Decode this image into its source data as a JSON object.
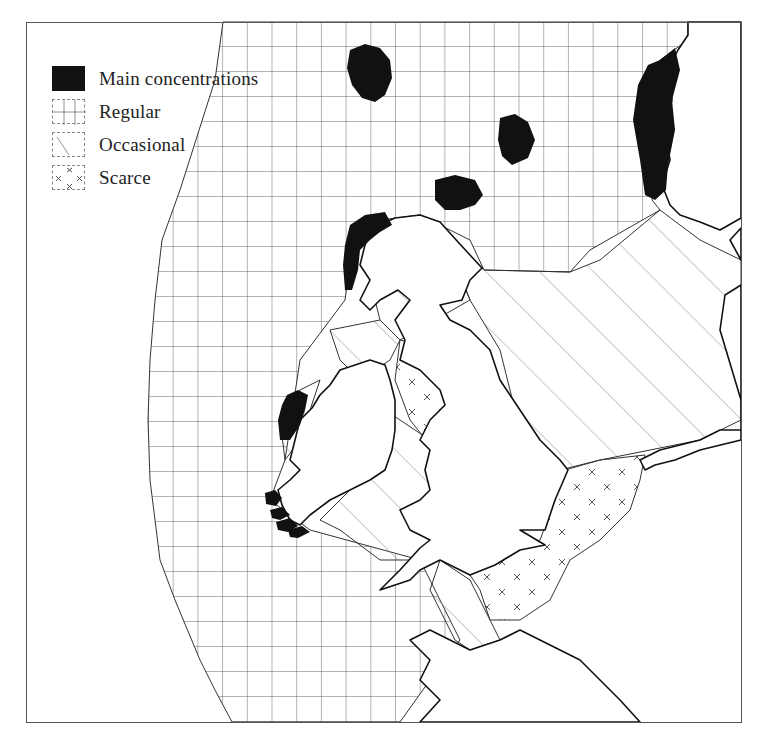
{
  "map": {
    "type": "distribution-map",
    "region": "British Isles, North Sea and NE Atlantic",
    "colors": {
      "ink": "#111111",
      "grid": "#555555",
      "hatch": "#777777",
      "land": "#ffffff",
      "background": "#ffffff"
    }
  },
  "legend": {
    "items": [
      {
        "key": "main",
        "label": "Main concentrations",
        "pattern": "solid-black"
      },
      {
        "key": "regular",
        "label": "Regular",
        "pattern": "grid"
      },
      {
        "key": "occasional",
        "label": "Occasional",
        "pattern": "diagonal-hatch"
      },
      {
        "key": "scarce",
        "label": "Scarce",
        "pattern": "crosses"
      }
    ]
  }
}
